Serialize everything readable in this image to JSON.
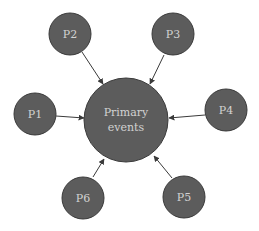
{
  "colors": {
    "background": "#ffffff",
    "node_fill": "#5c5c5c",
    "node_stroke": "#3a3a3a",
    "label_color": "#d2d2d2",
    "arrow_color": "#3a3a3a"
  },
  "center": {
    "id": "primary",
    "label_line1": "Primary",
    "label_line2": "events",
    "cx": 126,
    "cy": 120,
    "r": 42
  },
  "nodes": [
    {
      "id": "P1",
      "label": "P1",
      "cx": 35,
      "cy": 114,
      "r": 21
    },
    {
      "id": "P2",
      "label": "P2",
      "cx": 70,
      "cy": 34,
      "r": 21
    },
    {
      "id": "P3",
      "label": "P3",
      "cx": 173,
      "cy": 34,
      "r": 21
    },
    {
      "id": "P4",
      "label": "P4",
      "cx": 226,
      "cy": 110,
      "r": 21
    },
    {
      "id": "P5",
      "label": "P5",
      "cx": 184,
      "cy": 197,
      "r": 21
    },
    {
      "id": "P6",
      "label": "P6",
      "cx": 83,
      "cy": 198,
      "r": 21
    }
  ],
  "edges": [
    {
      "from": "P1",
      "to": "primary",
      "x1": 56,
      "y1": 116,
      "x2": 84,
      "y2": 118
    },
    {
      "from": "P2",
      "to": "primary",
      "x1": 82,
      "y1": 52,
      "x2": 103,
      "y2": 84
    },
    {
      "from": "P3",
      "to": "primary",
      "x1": 164,
      "y1": 55,
      "x2": 150,
      "y2": 84
    },
    {
      "from": "P4",
      "to": "primary",
      "x1": 205,
      "y1": 115,
      "x2": 169,
      "y2": 118
    },
    {
      "from": "P5",
      "to": "primary",
      "x1": 172,
      "y1": 178,
      "x2": 154,
      "y2": 156
    },
    {
      "from": "P6",
      "to": "primary",
      "x1": 93,
      "y1": 177,
      "x2": 104,
      "y2": 159
    }
  ]
}
